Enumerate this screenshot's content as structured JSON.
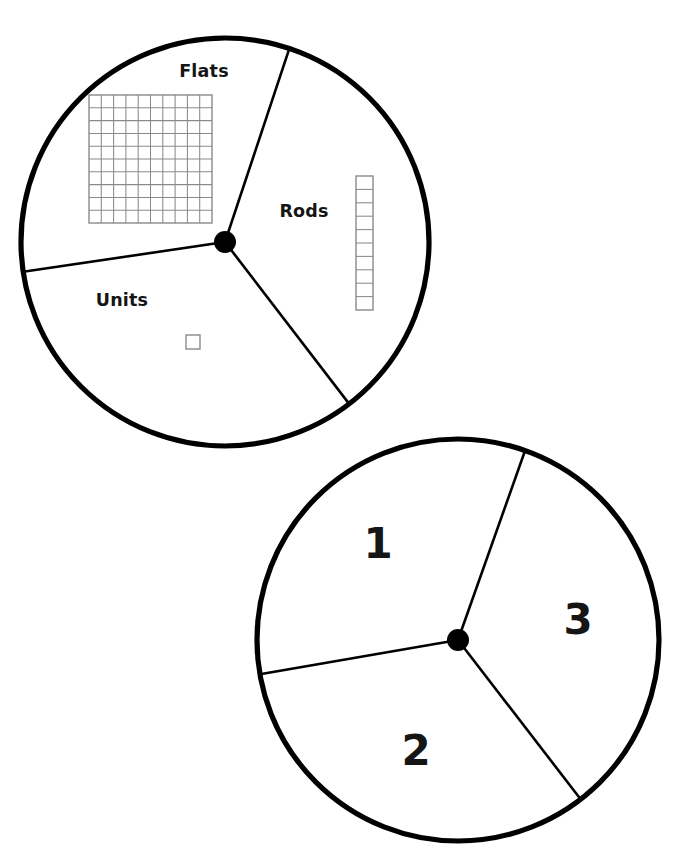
{
  "page": {
    "background_color": "#ffffff",
    "ink_color": "#000000",
    "block_outline_color": "#8a8a8a",
    "width": 688,
    "height": 863
  },
  "spinners": [
    {
      "id": "spinner-blocks",
      "name": "base-ten-block-spinner",
      "center": {
        "x": 225,
        "y": 242
      },
      "radius": 204,
      "hub_radius": 11,
      "divider_angles_deg": [
        -71.6,
        52.5,
        171.6
      ],
      "sectors": [
        {
          "id": "sector-flats",
          "label": "Flats",
          "label_position": {
            "x": 204,
            "y": 77
          },
          "illustration": "flat-10x10-grid",
          "illustration_value": 100
        },
        {
          "id": "sector-rods",
          "label": "Rods",
          "label_position": {
            "x": 304,
            "y": 217
          },
          "illustration": "rod-1x10-strip",
          "illustration_value": 10
        },
        {
          "id": "sector-units",
          "label": "Units",
          "label_position": {
            "x": 122,
            "y": 306
          },
          "illustration": "unit-single-square",
          "illustration_value": 1
        }
      ]
    },
    {
      "id": "spinner-numbers",
      "name": "number-spinner",
      "center": {
        "x": 458,
        "y": 640
      },
      "radius": 201,
      "hub_radius": 11,
      "divider_angles_deg": [
        -70.5,
        52.4,
        170.2
      ],
      "sectors": [
        {
          "id": "sector-one",
          "label": "1",
          "label_position": {
            "x": 378,
            "y": 558
          }
        },
        {
          "id": "sector-two",
          "label": "2",
          "label_position": {
            "x": 416,
            "y": 765
          }
        },
        {
          "id": "sector-three",
          "label": "3",
          "label_position": {
            "x": 578,
            "y": 634
          }
        }
      ]
    }
  ],
  "base_ten_blocks": {
    "flat": {
      "name": "flat-10x10-grid",
      "x": 89,
      "y": 95,
      "width": 123,
      "height": 128,
      "rows": 10,
      "cols": 10,
      "cell_count": 100
    },
    "rod": {
      "name": "rod-1x10-strip",
      "x": 356,
      "y": 176,
      "width": 17,
      "height": 134,
      "rows": 10,
      "cols": 1,
      "cell_count": 10
    },
    "unit": {
      "name": "unit-single-square",
      "x": 186,
      "y": 335,
      "width": 14,
      "height": 14,
      "rows": 1,
      "cols": 1,
      "cell_count": 1
    }
  }
}
